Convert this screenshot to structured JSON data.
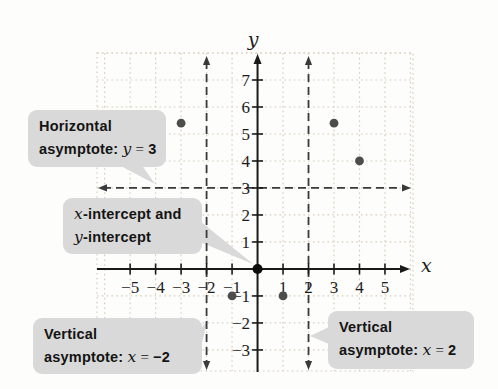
{
  "figure": {
    "bg": "#fdfdfc",
    "grid_color": "#d8cdbb",
    "axis_color": "#1a1a1a",
    "asymptote_color": "#3a3a3a",
    "point_color": "#4d4d4d",
    "origin_point_color": "#0d0d0d",
    "callout_bg": "#d9d9d9"
  },
  "chart_data": {
    "type": "scatter",
    "title": "",
    "xlabel": "x",
    "ylabel": "y",
    "xlim": [
      -6.3,
      6.1
    ],
    "ylim": [
      -3.78,
      8.0
    ],
    "grid": true,
    "x_ticks": [
      "-5",
      "-4",
      "-3",
      "-2",
      "-1",
      "1",
      "2",
      "3",
      "4",
      "5"
    ],
    "y_ticks": [
      "-3",
      "-2",
      "-1",
      "1",
      "2",
      "3",
      "4",
      "5",
      "6",
      "7"
    ],
    "points": [
      {
        "x": -3,
        "y": 5.4
      },
      {
        "x": -1,
        "y": -1
      },
      {
        "x": 0,
        "y": 0,
        "emphasis": true,
        "label": "x-intercept and y-intercept"
      },
      {
        "x": 1,
        "y": -1
      },
      {
        "x": 3,
        "y": 5.4
      },
      {
        "x": 4,
        "y": 4
      }
    ],
    "asymptotes": {
      "horizontal": [
        3
      ],
      "vertical": [
        -2,
        2
      ]
    },
    "legend": null
  },
  "callouts": {
    "horizontal": {
      "line1": "Horizontal",
      "prefix": "asymptote: ",
      "var": "y",
      "rel": " = ",
      "value": "3"
    },
    "intercepts": {
      "var1": "x",
      "text1": "-intercept and",
      "var2": "y",
      "text2": "-intercept"
    },
    "vertical_left": {
      "line1": "Vertical",
      "prefix": "asymptote: ",
      "var": "x",
      "rel": " = ",
      "value": "−2"
    },
    "vertical_right": {
      "line1": "Vertical",
      "prefix": "asymptote: ",
      "var": "x",
      "rel": " = ",
      "value": "2"
    }
  }
}
